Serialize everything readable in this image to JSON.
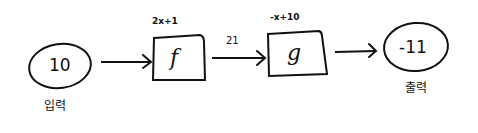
{
  "diagram": {
    "type": "function-composition",
    "nodes": {
      "input": {
        "value": "10",
        "caption": "입력"
      },
      "f": {
        "name": "f",
        "rule": "2x+1"
      },
      "g": {
        "name": "g",
        "rule": "-x+10"
      },
      "output": {
        "value": "-11",
        "caption": "출력"
      }
    },
    "edges": [
      {
        "from": "input",
        "to": "f",
        "label": ""
      },
      {
        "from": "f",
        "to": "g",
        "label": "21"
      },
      {
        "from": "g",
        "to": "output",
        "label": ""
      }
    ],
    "colors": {
      "ink": "#111111",
      "background": "#ffffff"
    }
  }
}
